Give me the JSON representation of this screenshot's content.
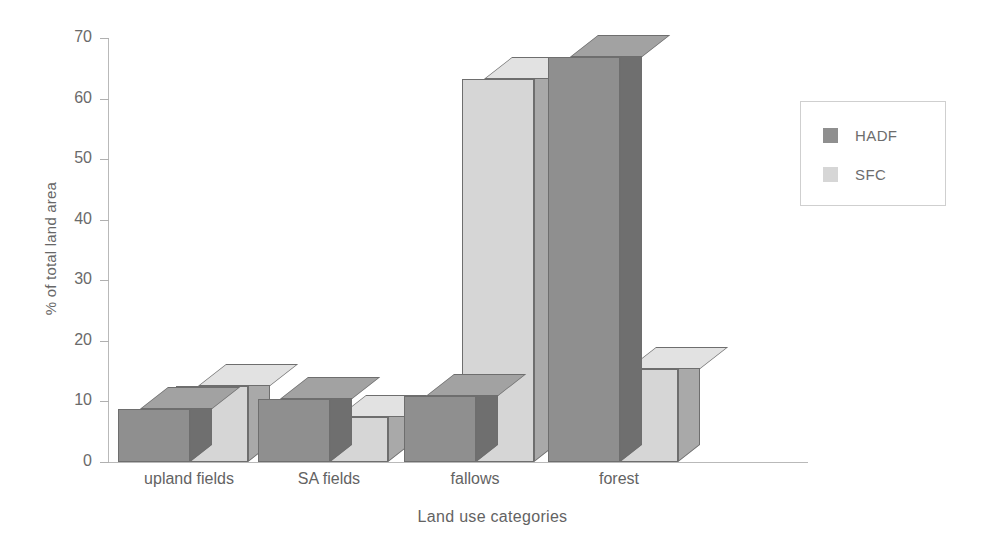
{
  "chart_data": {
    "type": "bar",
    "title": "",
    "xlabel": "Land use categories",
    "ylabel": "% of total land area",
    "categories": [
      "upland fields",
      "SA fields",
      "fallows",
      "forest"
    ],
    "series": [
      {
        "name": "HADF",
        "color": "#8f8f8f",
        "values": [
          8.7,
          10.4,
          10.9,
          66.8
        ]
      },
      {
        "name": "SFC",
        "color": "#d6d6d6",
        "values": [
          12.6,
          7.4,
          63.3,
          15.3
        ]
      }
    ],
    "ylim": [
      0,
      70
    ],
    "yticks": [
      0,
      10,
      20,
      30,
      40,
      50,
      60,
      70
    ],
    "ytick_labels": [
      "0",
      "10",
      "20",
      "30",
      "40",
      "50",
      "60",
      "70"
    ],
    "grid": false,
    "legend_position": "right",
    "style": "3d-grouped-bar"
  },
  "legend": {
    "entries": [
      {
        "label": "HADF",
        "color": "#8f8f8f"
      },
      {
        "label": "SFC",
        "color": "#d6d6d6"
      }
    ]
  }
}
